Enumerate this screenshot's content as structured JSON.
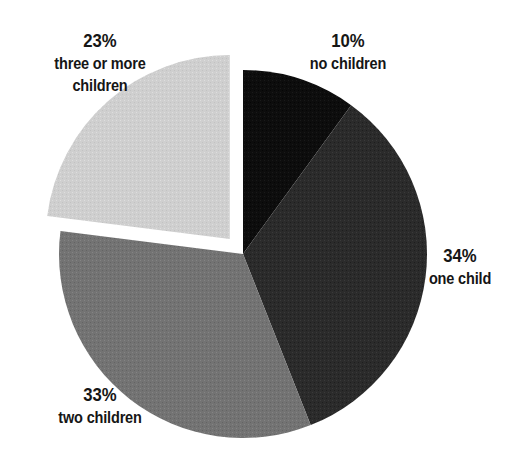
{
  "chart_data": {
    "type": "pie",
    "title": "",
    "subtitle": "",
    "xlabel": "",
    "ylabel": "",
    "legend_position": "none",
    "grid": false,
    "units": "percent",
    "start_angle_deg": 0,
    "direction": "clockwise",
    "center": {
      "x": 243,
      "y": 254
    },
    "radius": 184,
    "categories": [
      "no children",
      "one child",
      "two children",
      "three or more children"
    ],
    "values": [
      10,
      34,
      33,
      23
    ],
    "slices": [
      {
        "label": "no children",
        "label_lines": [
          "no children"
        ],
        "percent_text": "10%",
        "value": 10,
        "color": "#0d0d0d",
        "start_deg": 0,
        "end_deg": 36,
        "exploded": false,
        "explode_offset": 0
      },
      {
        "label": "one child",
        "label_lines": [
          "one child"
        ],
        "percent_text": "34%",
        "value": 34,
        "color": "#2b2b2b",
        "start_deg": 36,
        "end_deg": 158.4,
        "exploded": false,
        "explode_offset": 0
      },
      {
        "label": "two children",
        "label_lines": [
          "two children"
        ],
        "percent_text": "33%",
        "value": 33,
        "color": "#737373",
        "start_deg": 158.4,
        "end_deg": 277.2,
        "exploded": false,
        "explode_offset": 0
      },
      {
        "label": "three or more children",
        "label_lines": [
          "three or more",
          "children"
        ],
        "percent_text": "23%",
        "value": 23,
        "color": "#cfcfcf",
        "start_deg": 277.2,
        "end_deg": 360,
        "exploded": true,
        "explode_offset": 20
      }
    ]
  },
  "labels": {
    "no_children": {
      "percent": "10%",
      "line1": "no children",
      "line2": ""
    },
    "one_child": {
      "percent": "34%",
      "line1": "one child",
      "line2": ""
    },
    "two_children": {
      "percent": "33%",
      "line1": "two children",
      "line2": ""
    },
    "three_or_more_children": {
      "percent": "23%",
      "line1": "three or more",
      "line2": "children"
    }
  },
  "colors": {
    "background": "#ffffff",
    "text": "#161616",
    "slice_no_children": "#0d0d0d",
    "slice_one_child": "#2b2b2b",
    "slice_two_children": "#737373",
    "slice_three_or_more_children": "#cfcfcf"
  }
}
